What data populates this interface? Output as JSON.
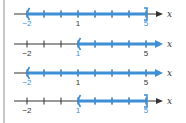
{
  "colors": {
    "highlight": "#3d8fd6",
    "axis": "#333333",
    "label_default": "#333333",
    "side_bar": "#c8c8c8"
  },
  "axis_variable": "x",
  "tick_range": {
    "min": -2,
    "max": 5,
    "step": 1
  },
  "labeled_ticks": [
    "-2",
    "1",
    "5"
  ],
  "number_lines": [
    {
      "id": "line-1",
      "interval": "(-2, 5]",
      "left": {
        "value": -2,
        "type": "open"
      },
      "right": {
        "value": 5,
        "type": "closed"
      },
      "labels": [
        {
          "text": "−2",
          "highlight": true
        },
        {
          "text": "1",
          "highlight": false
        },
        {
          "text": "5",
          "highlight": true
        }
      ]
    },
    {
      "id": "line-2",
      "interval": "(1, ∞)",
      "left": {
        "value": 1,
        "type": "open"
      },
      "right": {
        "value": null,
        "type": "arrow"
      },
      "labels": [
        {
          "text": "−2",
          "highlight": false
        },
        {
          "text": "1",
          "highlight": true
        },
        {
          "text": "5",
          "highlight": false
        }
      ]
    },
    {
      "id": "line-3",
      "interval": "(-2, ∞)",
      "left": {
        "value": -2,
        "type": "open"
      },
      "right": {
        "value": null,
        "type": "arrow"
      },
      "labels": [
        {
          "text": "−2",
          "highlight": true
        },
        {
          "text": "1",
          "highlight": false
        },
        {
          "text": "5",
          "highlight": false
        }
      ]
    },
    {
      "id": "line-4",
      "interval": "(1, 5]",
      "left": {
        "value": 1,
        "type": "open"
      },
      "right": {
        "value": 5,
        "type": "closed"
      },
      "labels": [
        {
          "text": "−2",
          "highlight": false
        },
        {
          "text": "1",
          "highlight": true
        },
        {
          "text": "5",
          "highlight": true
        }
      ]
    }
  ]
}
